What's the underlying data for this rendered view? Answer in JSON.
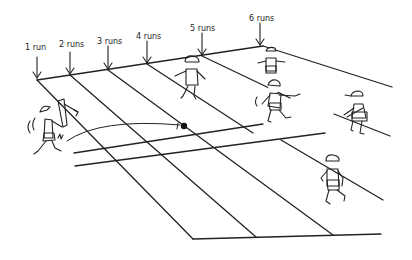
{
  "diagram": {
    "run_labels": [
      {
        "text": "1 run",
        "x": 25,
        "y": 43
      },
      {
        "text": "2 runs",
        "x": 59,
        "y": 40
      },
      {
        "text": "3 runs",
        "x": 97,
        "y": 37
      },
      {
        "text": "4 runs",
        "x": 136,
        "y": 32
      },
      {
        "text": "5 runs",
        "x": 190,
        "y": 24
      },
      {
        "text": "6 runs",
        "x": 249,
        "y": 14
      }
    ],
    "figures": [
      {
        "role": "batsman",
        "name": "batsman-swinging"
      },
      {
        "role": "fielder",
        "name": "fielder-center"
      },
      {
        "role": "fielder",
        "name": "fielder-back-right"
      },
      {
        "role": "fielder",
        "name": "fielder-diving"
      },
      {
        "role": "fielder",
        "name": "fielder-crouching"
      },
      {
        "role": "fielder",
        "name": "fielder-running-front"
      }
    ],
    "ball": {
      "name": "cricket-ball"
    }
  }
}
